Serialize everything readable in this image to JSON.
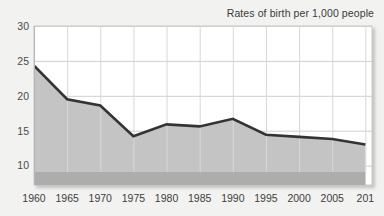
{
  "chart_data": {
    "type": "area",
    "title": "Rates of birth per 1,000 people",
    "xlabel": "",
    "ylabel": "",
    "x": [
      1960,
      1965,
      1970,
      1975,
      1980,
      1985,
      1990,
      1995,
      2000,
      2005,
      2010
    ],
    "categories": [
      "1960",
      "1965",
      "1970",
      "1975",
      "1980",
      "1985",
      "1990",
      "1995",
      "2000",
      "2005",
      "2010"
    ],
    "values": [
      24.3,
      19.5,
      18.6,
      14.2,
      15.9,
      15.6,
      16.7,
      14.4,
      14.1,
      13.8,
      13.0
    ],
    "series": [
      {
        "name": "Rates of birth per 1,000 people",
        "values": [
          24.3,
          19.5,
          18.6,
          14.2,
          15.9,
          15.6,
          16.7,
          14.4,
          14.1,
          13.8,
          13.0
        ]
      }
    ],
    "xlim": [
      1960,
      2011
    ],
    "ylim": [
      7.2,
      30
    ],
    "ytick_labels": [
      "30",
      "25",
      "20",
      "15",
      "10"
    ],
    "ytick_values": [
      30,
      25,
      20,
      15,
      10
    ],
    "xtick_labels": [
      "1960",
      "1965",
      "1970",
      "1975",
      "1980",
      "1985",
      "1990",
      "1995",
      "2000",
      "2005",
      "201"
    ],
    "xtick_values": [
      1960,
      1965,
      1970,
      1975,
      1980,
      1985,
      1990,
      1995,
      2000,
      2005,
      2010
    ],
    "grid": "horizontal-and-vertical",
    "legend": "none",
    "colors": {
      "line": "#333333",
      "fill": "#c4c4c4",
      "base_strip": "#adadad",
      "plot_background": "#ffffff",
      "page_background": "#f2f2f0",
      "gridline": "#cfcfcf",
      "axis_text": "#3d3d3d"
    }
  }
}
